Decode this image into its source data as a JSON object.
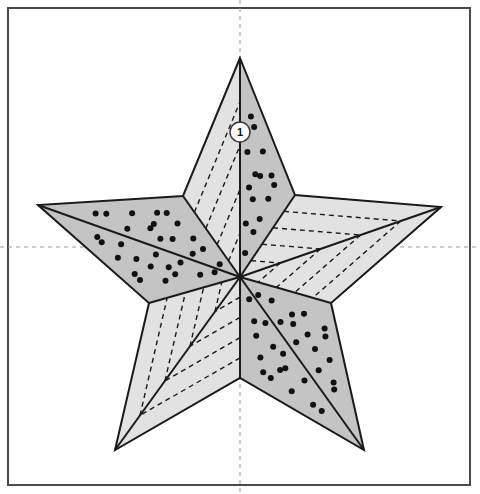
{
  "figure": {
    "type": "technical-illustration",
    "background_color": "#ffffff",
    "frame": {
      "name": "drawing-frame",
      "x": 8,
      "y": 8,
      "width": 462,
      "height": 477,
      "stroke_color": "#4a4a4a",
      "stroke_width": 2,
      "fill": "#ffffff"
    },
    "axes": {
      "name": "center-crosshair",
      "style": "dashed",
      "color": "#9a9a9a",
      "dash": "4 4",
      "vertical_x": 240,
      "horizontal_y": 247
    },
    "star": {
      "center": {
        "x": 240,
        "y": 277
      },
      "outer_points": [
        {
          "label": "top",
          "x": 240,
          "y": 58
        },
        {
          "label": "right",
          "x": 441,
          "y": 207
        },
        {
          "label": "bottom-right",
          "x": 364,
          "y": 450
        },
        {
          "label": "bottom-left",
          "x": 115,
          "y": 450
        },
        {
          "label": "left",
          "x": 38,
          "y": 205
        }
      ],
      "inner_points": [
        {
          "label": "upper-right",
          "x": 295,
          "y": 195
        },
        {
          "label": "right-lower",
          "x": 331,
          "y": 303
        },
        {
          "label": "bottom",
          "x": 240,
          "y": 378
        },
        {
          "label": "left-lower",
          "x": 149,
          "y": 303
        },
        {
          "label": "upper-left",
          "x": 183,
          "y": 196
        }
      ],
      "face_dark_color": "#c4c4c4",
      "face_light_color": "#e2e2e2",
      "edge_color": "#1a1a1a",
      "edge_width": 2,
      "hidden_edge_color": "#1a1a1a",
      "hidden_edge_dash": "5 4",
      "stipple_dot_color": "#111111",
      "stipple_dot_radius": 3
    },
    "callout": {
      "name": "callout-marker-1",
      "label": "1",
      "x": 240,
      "y": 132,
      "radius": 10,
      "fill": "#ffffff",
      "stroke_color": "#3a3a3a",
      "stroke_width": 1.5,
      "text_color": "#111111"
    }
  },
  "chart_data": {
    "type": "diagram",
    "title": "",
    "legend": [],
    "annotations": [
      {
        "id": "1",
        "text": "1",
        "x": 240,
        "y": 132
      }
    ]
  }
}
